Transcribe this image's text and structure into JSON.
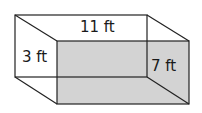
{
  "diagram": {
    "type": "rectangular-prism",
    "colors": {
      "front_face": "#d3d3d3",
      "edges": "#222222",
      "background": "#ffffff"
    },
    "labels": {
      "top_length": "11 ft",
      "left_height": "3 ft",
      "right_depth": "7 ft"
    }
  }
}
